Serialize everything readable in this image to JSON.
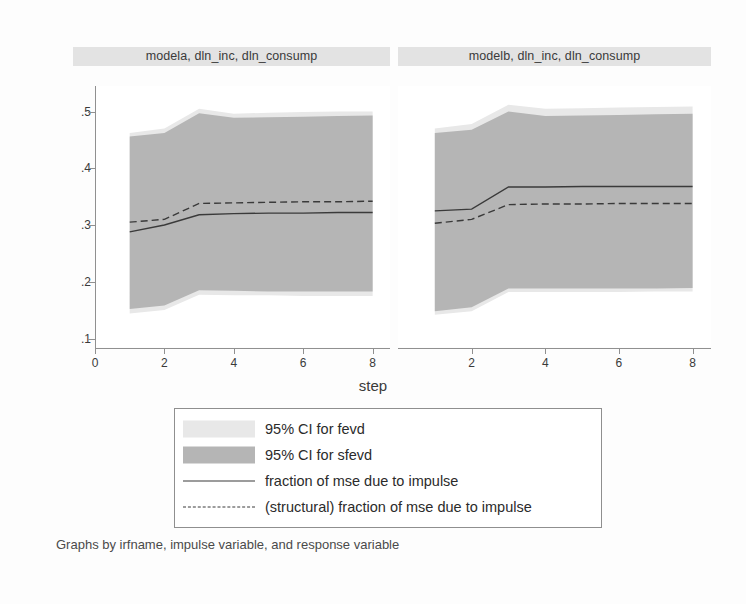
{
  "panels": [
    {
      "id": "modela",
      "title": "modela, dln_inc, dln_consump"
    },
    {
      "id": "modelb",
      "title": "modelb, dln_inc, dln_consump"
    }
  ],
  "axis": {
    "xlabel": "step",
    "yticks": [
      ".1",
      ".2",
      ".3",
      ".4",
      ".5"
    ],
    "xticks_left": [
      "0",
      "2",
      "4",
      "6",
      "8"
    ],
    "xticks_right": [
      "2",
      "4",
      "6",
      "8"
    ]
  },
  "legend": {
    "items": [
      {
        "key": "band-light",
        "label": "95% CI for fevd"
      },
      {
        "key": "band-dark",
        "label": "95% CI for sfevd"
      },
      {
        "key": "line-solid",
        "label": "fraction of mse due to impulse"
      },
      {
        "key": "line-dashed",
        "label": "(structural) fraction of mse due to impulse"
      }
    ]
  },
  "caption": "Graphs by irfname, impulse variable, and response variable",
  "colors": {
    "ci_fevd": "#e8e8e8",
    "ci_sfevd": "#b5b5b5",
    "line": "#3a3a3a",
    "axis": "#909090",
    "title_bar": "#e3e3e3",
    "plot_bg": "#ffffff",
    "page_bg": "#fdfdfd"
  },
  "chart_data": {
    "type": "area",
    "xlabel": "step",
    "ylabel": "",
    "xlim": [
      0,
      8.5
    ],
    "ylim": [
      0.085,
      0.545
    ],
    "grid": false,
    "legend_position": "bottom",
    "panels": [
      {
        "name": "modela, dln_inc, dln_consump",
        "x": [
          1,
          2,
          3,
          4,
          5,
          6,
          7,
          8
        ],
        "series": [
          {
            "name": "fraction of mse due to impulse",
            "style": "solid",
            "values": [
              0.288,
              0.3,
              0.318,
              0.32,
              0.321,
              0.321,
              0.322,
              0.322
            ]
          },
          {
            "name": "(structural) fraction of mse due to impulse",
            "style": "dashed",
            "values": [
              0.305,
              0.31,
              0.338,
              0.339,
              0.34,
              0.341,
              0.341,
              0.342
            ]
          },
          {
            "name": "95% CI for fevd",
            "style": "band",
            "fill": "#e8e8e8",
            "upper": [
              0.462,
              0.47,
              0.505,
              0.496,
              0.498,
              0.499,
              0.5,
              0.5
            ],
            "lower": [
              0.144,
              0.15,
              0.177,
              0.176,
              0.176,
              0.175,
              0.175,
              0.175
            ]
          },
          {
            "name": "95% CI for sfevd",
            "style": "band",
            "fill": "#b5b5b5",
            "upper": [
              0.456,
              0.462,
              0.497,
              0.489,
              0.49,
              0.491,
              0.492,
              0.493
            ],
            "lower": [
              0.152,
              0.158,
              0.185,
              0.184,
              0.183,
              0.183,
              0.183,
              0.183
            ]
          }
        ]
      },
      {
        "name": "modelb, dln_inc, dln_consump",
        "x": [
          1,
          2,
          3,
          4,
          5,
          6,
          7,
          8
        ],
        "series": [
          {
            "name": "fraction of mse due to impulse",
            "style": "solid",
            "values": [
              0.325,
              0.328,
              0.367,
              0.367,
              0.368,
              0.368,
              0.368,
              0.368
            ]
          },
          {
            "name": "(structural) fraction of mse due to impulse",
            "style": "dashed",
            "values": [
              0.303,
              0.31,
              0.336,
              0.337,
              0.337,
              0.338,
              0.338,
              0.338
            ]
          },
          {
            "name": "95% CI for fevd",
            "style": "band",
            "fill": "#e8e8e8",
            "upper": [
              0.47,
              0.478,
              0.512,
              0.505,
              0.506,
              0.507,
              0.508,
              0.509
            ],
            "lower": [
              0.142,
              0.148,
              0.182,
              0.182,
              0.182,
              0.182,
              0.183,
              0.183
            ]
          },
          {
            "name": "95% CI for sfevd",
            "style": "band",
            "fill": "#b5b5b5",
            "upper": [
              0.462,
              0.468,
              0.5,
              0.492,
              0.493,
              0.494,
              0.495,
              0.496
            ],
            "lower": [
              0.148,
              0.155,
              0.188,
              0.188,
              0.188,
              0.188,
              0.188,
              0.189
            ]
          }
        ]
      }
    ]
  }
}
